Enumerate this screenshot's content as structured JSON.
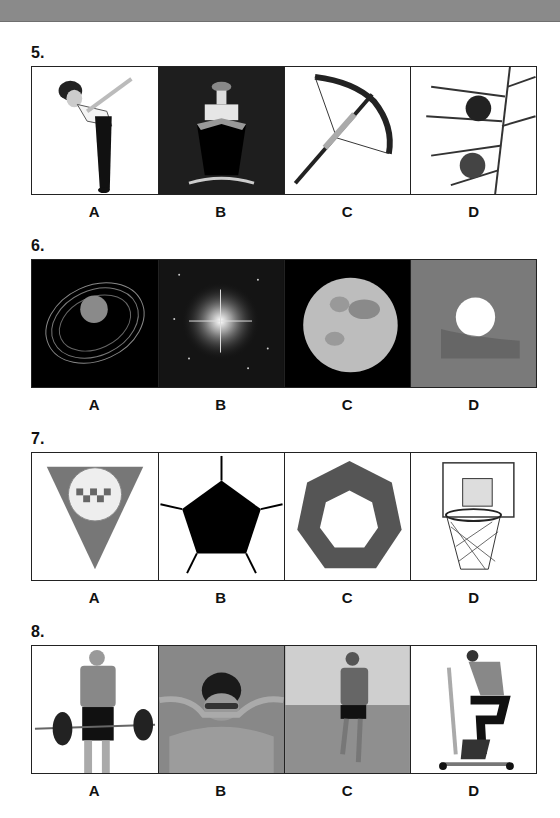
{
  "header": {
    "bar": ""
  },
  "questions": [
    {
      "number": "5.",
      "options": [
        {
          "letter": "A",
          "image": "woman-bowing"
        },
        {
          "letter": "B",
          "image": "ship-bow-front"
        },
        {
          "letter": "C",
          "image": "crossbow"
        },
        {
          "letter": "D",
          "image": "christmas-tree-branch-with-baubles"
        }
      ]
    },
    {
      "number": "6.",
      "options": [
        {
          "letter": "A",
          "image": "ringed-planet"
        },
        {
          "letter": "B",
          "image": "bright-star"
        },
        {
          "letter": "C",
          "image": "full-moon"
        },
        {
          "letter": "D",
          "image": "sun-behind-clouds"
        }
      ]
    },
    {
      "number": "7.",
      "options": [
        {
          "letter": "A",
          "image": "inverted-triangle-taxi-icon"
        },
        {
          "letter": "B",
          "image": "pentagon"
        },
        {
          "letter": "C",
          "image": "heptagon-puzzle-ring"
        },
        {
          "letter": "D",
          "image": "basketball-hoop"
        }
      ]
    },
    {
      "number": "8.",
      "options": [
        {
          "letter": "A",
          "image": "man-lifting-barbell"
        },
        {
          "letter": "B",
          "image": "woman-swimming-butterfly"
        },
        {
          "letter": "C",
          "image": "man-running"
        },
        {
          "letter": "D",
          "image": "woman-on-exercise-bike"
        }
      ]
    }
  ]
}
